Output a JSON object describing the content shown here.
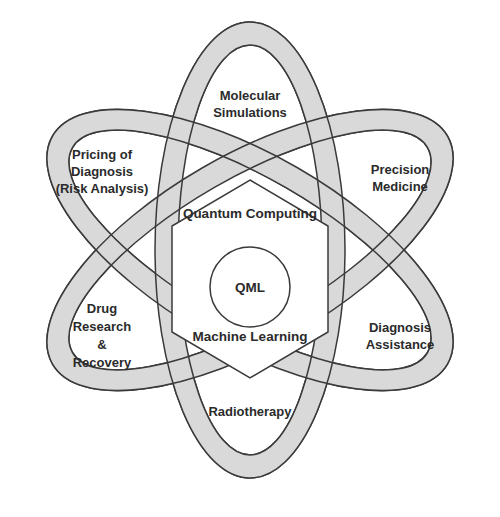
{
  "diagram": {
    "type": "atom-diagram",
    "center": {
      "core": "QML",
      "hexagon_top_label": "Quantum Computing",
      "hexagon_bottom_label": "Machine Learning"
    },
    "lobes": [
      {
        "position": "top",
        "lines": [
          "Molecular",
          "Simulations"
        ]
      },
      {
        "position": "upper-right",
        "lines": [
          "Precision",
          "Medicine"
        ]
      },
      {
        "position": "lower-right",
        "lines": [
          "Diagnosis",
          "Assistance"
        ]
      },
      {
        "position": "bottom",
        "lines": [
          "Radiotherapy"
        ]
      },
      {
        "position": "lower-left",
        "lines": [
          "Drug",
          "Research",
          "&",
          "Recovery"
        ]
      },
      {
        "position": "upper-left",
        "lines": [
          "Pricing of",
          "Diagnosis",
          "(Risk Analysis)"
        ]
      }
    ],
    "colors": {
      "band_fill": "#d9d9d9",
      "band_stroke": "#3a3a3a",
      "inner_fill": "#ffffff",
      "text": "#2b2b2b"
    }
  }
}
